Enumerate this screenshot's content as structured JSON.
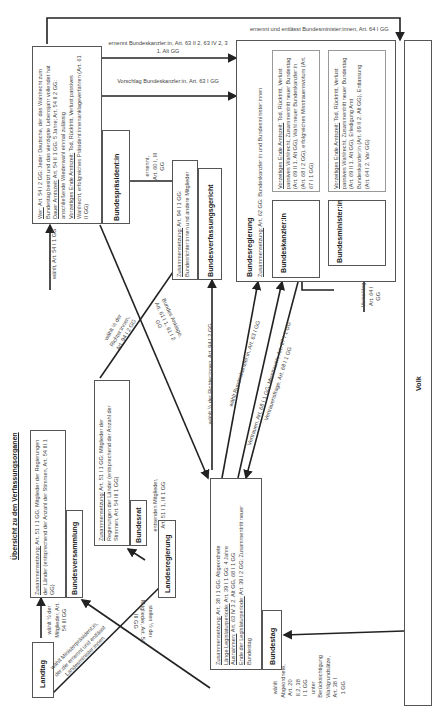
{
  "diagram": {
    "title": "Übersicht zu den Verfassungsorganen",
    "nodes": {
      "landtag": {
        "label": "Landtag"
      },
      "bundesversammlung": {
        "label": "Bundesversammlung",
        "composition_label": "Zusammensetzung:",
        "composition": "Art. 51 I 1 GG: Mitglieder der Regierungen der Länder (entsprechend der Anzahl der Stimmen, Art. 54 III 1 GG)"
      },
      "bundesrat": {
        "label": "Bundesrat",
        "composition_label": "Zusammensetzung:",
        "composition": "Art. 51 I 1 GG: Mitglieder der Regierungen der Länder (entsprechend der Anzahl der Stimmen, Art. 54 III 1 GG)"
      },
      "landesregierung": {
        "label": "Landesregierung"
      },
      "bundestag": {
        "label": "Bundestag",
        "composition_label": "Zusammensetzung:",
        "composition": "Art. 38 I 1 GG: Abgeordnete",
        "period_label": "Länge Legislaturperiode:",
        "period": "Art. 39 I 1 GG: 4 Jahre",
        "exceptions_label": "Ausnahmen:",
        "exceptions": "Art. 63 IV 3 2. Alt GG, 68 I 1 GG",
        "end_label": "Ende der Legislaturperiode:",
        "end": "Art. 39 I 2 GG: Zusammentritt neuer Bundestag"
      },
      "bundespraesident": {
        "label": "Bundespräsident:in",
        "who_label": "Wer:",
        "who": "Art. 54 I 2 GG: Jeder Deutsche, der das Wahlrecht zum Bundestag besitzt und das vierzigste Lebensjahr vollendet hat",
        "term_label": "Dauer Amtszeit:",
        "term": "Art. 54 II 1 GG: 5 Jahre; Art. 54 II 2 GG: anschließende Wiederwahl einmal zulässig",
        "early_end_label": "Vorzeitiges Ende Amtszeit:",
        "early_end": "Tod, Rücktritt, Verlust passives Wahlrecht, erfolgreiches Präsident:innenanklageverfahren (Art. 61 II GG)"
      },
      "bundesverfassungsgericht": {
        "label": "Bundesverfassungsgericht",
        "composition_label": "Zusammensetzung:",
        "composition": "Art. 94 I 1 GG: Bundesrichter:innen und andere Mitglieder"
      },
      "bundesregierung": {
        "label": "Bundesregierung",
        "composition_label": "Zusammensetzung:",
        "composition": "Art. 62 GG: Bundeskanzler:in und Bundesminister:innen"
      },
      "bundeskanzler": {
        "label": "Bundeskanzler:in",
        "early_end_label": "Vorzeitiges Ende Amtszeit:",
        "early_end": "Tod, Rücktritt, Verlust passives Wahlrecht, Zusammentritt neuer Bundestag (Art. 69 II 1. Alt GG), Wahl neuer Bundeskanzler:in (Art. 68 I 2 GG), erfolgreiches Misstrauensvotum (Art. 67 I 1 GG)"
      },
      "bundesminister": {
        "label": "Bundesminister:in",
        "early_end_label": "Vorzeitiges Ende Amtszeit:",
        "early_end": "Tod, Rücktritt, Verlust passives Wahlrecht, Zusammentritt neuer Bundestag (Art. 69 II 1. Alt GG), Erledigung Amt Bundeskanzler:in (Art. 69 II 2. Alt GG), Entlassung (Art. 64 I 2. Var GG)"
      },
      "volk": {
        "label": "Volk"
      }
    },
    "edges": {
      "landtag_bv": "wählt ½ der Mitglieder, Art. 54 III GG",
      "bv_bp": "wählt, Art. 54 I 1 GG",
      "bp_bverfg": "ernennt, Art. 60 I, III GG",
      "bp_breg_ernennt": "ernennt Bundeskanzler:in, Art. 63 II 2, 63 IV 2, 3 1. Alt GG",
      "bp_breg_vorschlag": "Vorschlag Bundeskanzler:in, Art. 63 I GG",
      "bp_minister": "ernennt und entlässt Bundesminister:innen, Art. 64 I GG",
      "br_bverfg": "wählt ½ der Richter:innen, Art. 94 I 2 GG",
      "bt_bp_anklage": "Bundes Anklage, Art. 61 I 1, 61 I 2 GG",
      "bt_bverfg": "wählt ½ der Richter:innen, Art. 94 I 2 GG",
      "bt_kanzler_wahl": "wählt Bundeskanzler:in, Art. 63 I GG",
      "bt_kanzler_vertrauen": "Vertrauen, Art. 68 I 1 GG; Misstrauen, Art. 67 I 1 GG",
      "kanzler_bt_frage": "Vertrauensfrage, Art. 68 I 1 GG",
      "kanzler_minister": "Vorschlag, Art. 64 I GG",
      "lreg_br": "entsenden Mitglieder, Art. 51 I 1, III 1 GG",
      "lreg_bv": "stellen ½ der Mitglieder, Art. 54 III GG",
      "landtag_lreg": "wählt Ministerpräsident:in, der:die ernennt und entlässt Landesminister:innen",
      "volk_bt": "wählt Abgeordnete, Art. 20 II 2, 38 I 1 GG unter Berücksichtigung Wahlgrundsätze, Art. 38 I 1 GG"
    }
  }
}
